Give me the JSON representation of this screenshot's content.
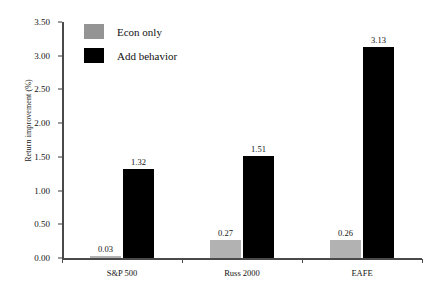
{
  "chart_data": {
    "type": "bar",
    "title": "",
    "xlabel": "",
    "ylabel": "Return improvement (%)",
    "categories": [
      "S&P 500",
      "Russ 2000",
      "EAFE"
    ],
    "series": [
      {
        "name": "Econ only",
        "color": "#b2b2b2",
        "values": [
          0.03,
          0.27,
          0.26
        ]
      },
      {
        "name": "Add behavior",
        "color": "#000000",
        "values": [
          1.32,
          1.51,
          3.13
        ]
      }
    ],
    "value_labels": [
      [
        "0.03",
        "0.27",
        "0.26"
      ],
      [
        "1.32",
        "1.51",
        "3.13"
      ]
    ],
    "ylim": [
      0.0,
      3.5
    ],
    "ytick_labels": [
      "0.00",
      "0.50",
      "1.00",
      "1.50",
      "2.00",
      "2.50",
      "3.00",
      "3.50"
    ],
    "ytick_values": [
      0.0,
      0.5,
      1.0,
      1.5,
      2.0,
      2.5,
      3.0,
      3.5
    ],
    "grid": false,
    "legend_position": "upper-left-inside"
  },
  "legend": {
    "entries": [
      {
        "label": "Econ only",
        "swatch": "#949494"
      },
      {
        "label": "Add behavior",
        "swatch": "#000000"
      }
    ]
  },
  "axes": {
    "y_title": "Return improvement (%)",
    "axis_color": "#4a4a4a"
  }
}
